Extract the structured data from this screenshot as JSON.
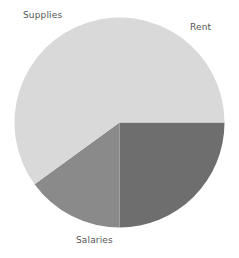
{
  "canvas": {
    "width": 239,
    "height": 258,
    "background": "#ffffff"
  },
  "chart_data": {
    "type": "pie",
    "title": "",
    "subtitle": "",
    "xlabel": "",
    "ylabel": "",
    "legend_position": "none",
    "grid": false,
    "labels_position": "outside",
    "start_angle_deg": 0,
    "direction": "clockwise",
    "center": {
      "x": 119.5,
      "y": 122.5
    },
    "radius": 105,
    "categories": [
      "Rent",
      "Supplies",
      "Salaries"
    ],
    "values": [
      25,
      15,
      60
    ],
    "value_unit": "percent",
    "colors": [
      "#6e6e6e",
      "#8a8a8a",
      "#d9d9d9"
    ],
    "slices": [
      {
        "label": "Rent",
        "value": 25,
        "percent": 25,
        "angle_deg": 90,
        "start_deg": 0,
        "end_deg": 90,
        "color": "#6e6e6e",
        "label_x": 190,
        "label_y": 22
      },
      {
        "label": "Supplies",
        "value": 15,
        "percent": 15,
        "angle_deg": 54,
        "start_deg": 90,
        "end_deg": 144,
        "color": "#8a8a8a",
        "label_x": 23,
        "label_y": 10
      },
      {
        "label": "Salaries",
        "value": 60,
        "percent": 60,
        "angle_deg": 216,
        "start_deg": 144,
        "end_deg": 360,
        "color": "#d9d9d9",
        "label_x": 76,
        "label_y": 235
      }
    ],
    "label_color": "#555555",
    "label_font_size": 9
  }
}
